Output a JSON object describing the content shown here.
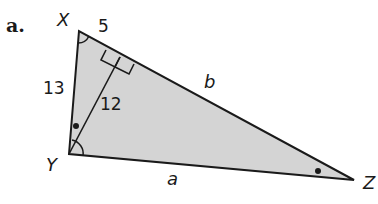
{
  "problem": {
    "part_label": "a."
  },
  "triangle": {
    "fill_color": "#d4d4d4",
    "stroke_color": "#1a1a1a",
    "vertices": {
      "X": {
        "label": "X"
      },
      "Y": {
        "label": "Y"
      },
      "Z": {
        "label": "Z"
      }
    },
    "sides": {
      "XY": {
        "label": "13"
      },
      "XZ": {
        "label": "b"
      },
      "YZ": {
        "label": "a"
      }
    },
    "segments": {
      "X_to_foot": {
        "label": "5"
      },
      "altitude": {
        "label": "12"
      }
    },
    "markers": {
      "right_angle": "altitude foot on XZ",
      "angle_arc_X": "single arc at X",
      "angle_arc_Y": "single arc at Y",
      "dot_Y": "congruent-angle dot near Y (angle between YX and altitude)",
      "dot_Z": "congruent-angle dot at Z"
    }
  }
}
